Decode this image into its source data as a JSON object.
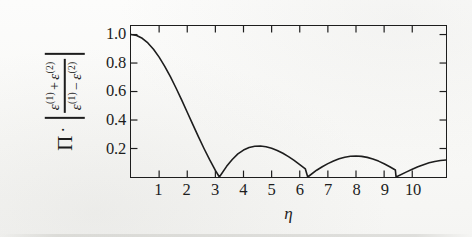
{
  "figure": {
    "background_color": "#fbfbfa",
    "ink_color": "#1d1d1d"
  },
  "ylabel": {
    "pi_symbol": "Π",
    "dot_operator": "·",
    "numerator_first": "ε",
    "numerator_first_sup": "(1)",
    "numerator_op": "+",
    "numerator_second": "ε",
    "numerator_second_sup": "(2)",
    "denominator_first": "ε",
    "denominator_first_sup": "(1)",
    "denominator_op": "−",
    "denominator_second": "ε",
    "denominator_second_sup": "(2)",
    "plain_text": "Π · |(ε(1) + ε(2)) / (ε(1) − ε(2))|"
  },
  "xaxis": {
    "title": "η"
  },
  "chart_data": {
    "type": "line",
    "title": "",
    "subtitle": "",
    "xlabel": "η",
    "ylabel": "Π · |(ε(1) + ε(2)) / (ε(1) − ε(2))|",
    "xlim": [
      0,
      11.2
    ],
    "ylim": [
      0,
      1.06
    ],
    "grid": false,
    "legend": null,
    "legend_position": "none",
    "xticks": [
      1,
      2,
      3,
      4,
      5,
      6,
      7,
      8,
      9,
      10
    ],
    "xticklabels": [
      "1",
      "2",
      "3",
      "4",
      "5",
      "6",
      "7",
      "8",
      "9",
      "10"
    ],
    "yticks": [
      0.2,
      0.4,
      0.6,
      0.8,
      1.0
    ],
    "yticklabels": [
      "0.2",
      "0.4",
      "0.6",
      "0.8",
      "1.0"
    ],
    "tick_direction": "in",
    "ticks_on_all_sides": true,
    "series": [
      {
        "name": "|sin(η)/η|",
        "color": "#1d1d1d",
        "linewidth": 1.6,
        "x": [
          0.0,
          0.2,
          0.4,
          0.6,
          0.8,
          1.0,
          1.2,
          1.4,
          1.6,
          1.8,
          2.0,
          2.2,
          2.4,
          2.6,
          2.8,
          3.0,
          3.14159,
          3.4,
          3.6,
          3.8,
          4.0,
          4.2,
          4.4,
          4.6,
          4.8,
          5.0,
          5.2,
          5.4,
          5.6,
          5.8,
          6.0,
          6.2,
          6.28319,
          6.6,
          6.8,
          7.0,
          7.2,
          7.4,
          7.6,
          7.8,
          8.0,
          8.2,
          8.4,
          8.6,
          8.8,
          9.0,
          9.2,
          9.4,
          9.42478,
          9.8,
          10.0,
          10.2,
          10.4,
          10.6,
          10.8,
          11.0,
          11.2
        ],
        "y": [
          1.0,
          0.9933,
          0.9735,
          0.9411,
          0.8967,
          0.8415,
          0.7767,
          0.7039,
          0.6247,
          0.541,
          0.4546,
          0.3675,
          0.2814,
          0.1983,
          0.1196,
          0.047,
          0.0,
          0.0748,
          0.1229,
          0.162,
          0.1892,
          0.2065,
          0.2155,
          0.2172,
          0.2125,
          0.2021,
          0.1865,
          0.1665,
          0.1428,
          0.1162,
          0.0872,
          0.0566,
          0.0,
          0.0477,
          0.0719,
          0.0939,
          0.1128,
          0.128,
          0.1392,
          0.1458,
          0.1477,
          0.145,
          0.1378,
          0.1266,
          0.1115,
          0.0931,
          0.072,
          0.0488,
          0.0,
          0.036,
          0.0544,
          0.0715,
          0.0867,
          0.0995,
          0.1094,
          0.1162,
          0.1197
        ]
      }
    ]
  }
}
